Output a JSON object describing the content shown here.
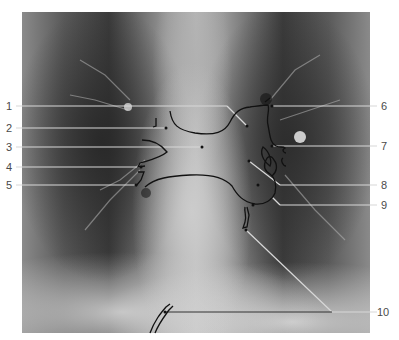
{
  "figure": {
    "type": "chest-radiograph-annotated",
    "view": "posteroanterior"
  },
  "labels": [
    {
      "id": "1",
      "text": "1",
      "side": "left",
      "y": 106
    },
    {
      "id": "2",
      "text": "2",
      "side": "left",
      "y": 128
    },
    {
      "id": "3",
      "text": "3",
      "side": "left",
      "y": 147
    },
    {
      "id": "4",
      "text": "4",
      "side": "left",
      "y": 167
    },
    {
      "id": "5",
      "text": "5",
      "side": "left",
      "y": 185
    },
    {
      "id": "6",
      "text": "6",
      "side": "right",
      "y": 106
    },
    {
      "id": "7",
      "text": "7",
      "side": "right",
      "y": 146
    },
    {
      "id": "8",
      "text": "8",
      "side": "right",
      "y": 185
    },
    {
      "id": "9",
      "text": "9",
      "side": "right",
      "y": 205
    },
    {
      "id": "10",
      "text": "10",
      "side": "right",
      "y": 312
    }
  ],
  "colors": {
    "leader_line": "#d8d8d8",
    "outline": "#111111",
    "label_text": "#4a4a4a",
    "background": "#ffffff"
  }
}
